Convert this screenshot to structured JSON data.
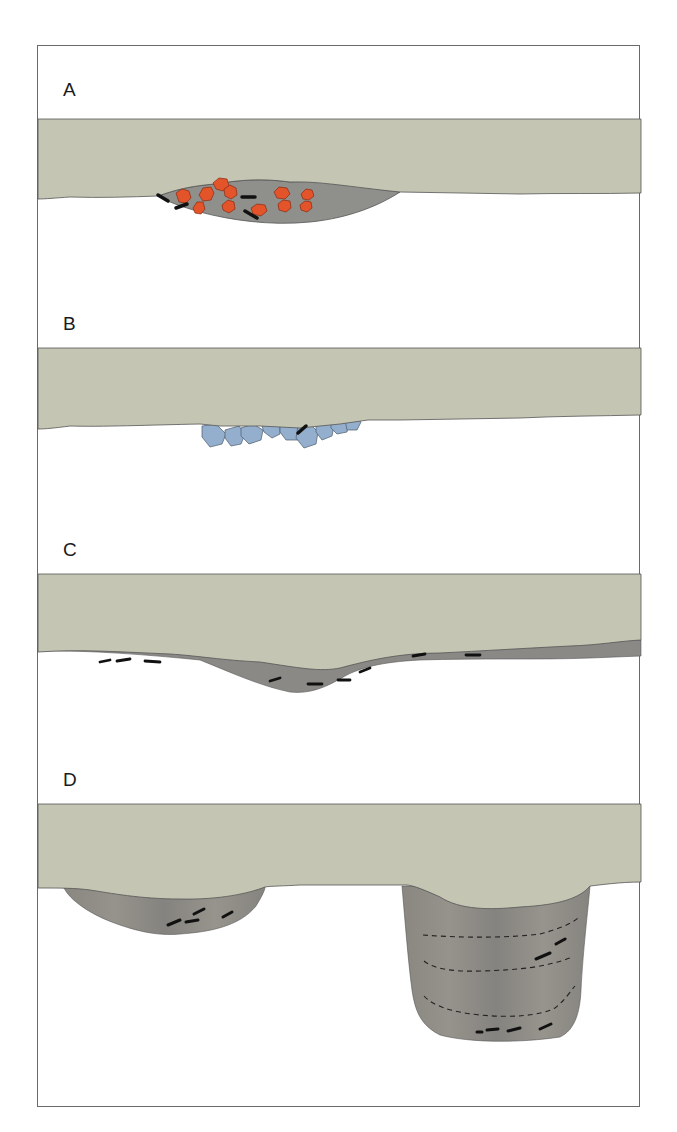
{
  "figure": {
    "type": "cross-section diagram",
    "panels": [
      {
        "id": "A",
        "label": "A",
        "description": "Shallow lens-shaped basin beneath ground layer containing red-orange fire-cracked rocks and black charcoal fragments"
      },
      {
        "id": "B",
        "label": "B",
        "description": "Cluster of blue-gray cobbles/stones just below ground layer with one charcoal fragment"
      },
      {
        "id": "C",
        "label": "C",
        "description": "Thin dark-gray occupation layer beneath ground with shallow dip, containing scattered charcoal fragments"
      },
      {
        "id": "D",
        "label": "D",
        "description": "Two pits: a shallow bowl-shaped pit on the left and a deep straight-sided pit on the right with dashed stratigraphic fill lines and charcoal fragments"
      }
    ]
  },
  "colors": {
    "ground_layer": "#c4c5b2",
    "ground_outline": "#555555",
    "fill_gray": "#8e8d88",
    "fill_dark": "#7f7e7a",
    "rock_red": "#e4542a",
    "rock_outline": "#8a2a10",
    "stone_blue": "#93afcd",
    "stone_outline": "#4c5a6a",
    "charcoal": "#111111",
    "frame": "#6a6a6a"
  }
}
